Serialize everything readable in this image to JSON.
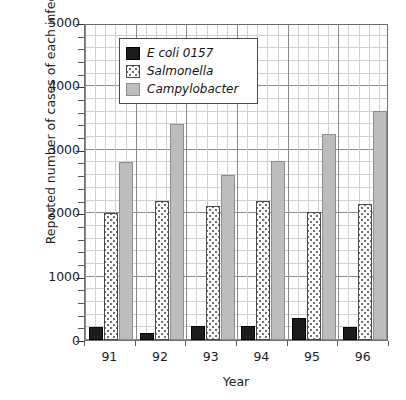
{
  "chart_data": {
    "type": "bar",
    "title": "",
    "xlabel": "Year",
    "ylabel": "Reported number of cases of each infection",
    "categories": [
      "91",
      "92",
      "93",
      "94",
      "95",
      "96"
    ],
    "series": [
      {
        "name": "E coli 0157",
        "values": [
          200,
          110,
          220,
          220,
          340,
          210
        ],
        "color": "#1c1c1c",
        "fill": "solid-black"
      },
      {
        "name": "Salmonella",
        "values": [
          2000,
          2200,
          2120,
          2200,
          2020,
          2150
        ],
        "color": "#fdfdfd",
        "fill": "dotted"
      },
      {
        "name": "Campylobacter",
        "values": [
          2800,
          3400,
          2600,
          2830,
          3250,
          3620
        ],
        "color": "#bdbdbd",
        "fill": "solid-gray"
      }
    ],
    "ylim": [
      0,
      5000
    ],
    "ytick_labels": [
      "0",
      "1000",
      "2000",
      "3000",
      "4000",
      "5000"
    ],
    "ytick_values": [
      0,
      1000,
      2000,
      3000,
      4000,
      5000
    ],
    "yminor_step": 200,
    "grid": true,
    "legend_position": "upper-left-inside"
  },
  "legend": {
    "items": [
      {
        "label": "E coli 0157",
        "swatch": "black-square-icon"
      },
      {
        "label": "Salmonella",
        "swatch": "dotted-square-icon"
      },
      {
        "label": "Campylobacter",
        "swatch": "gray-square-icon"
      }
    ]
  }
}
